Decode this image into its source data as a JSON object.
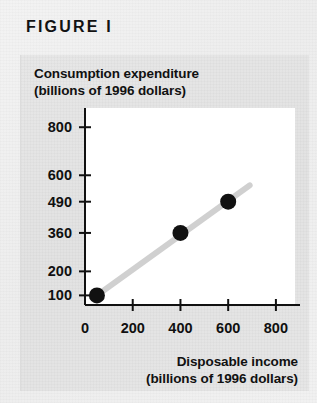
{
  "figure": {
    "label": "FIGURE  I"
  },
  "chart_data": {
    "type": "scatter",
    "title": "",
    "ylabel_line1": "Consumption expenditure",
    "ylabel_line2": "(billions of 1996 dollars)",
    "xlabel_line1": "Disposable income",
    "xlabel_line2": "(billions of 1996 dollars)",
    "x": [
      50,
      400,
      600
    ],
    "values": [
      100,
      360,
      490
    ],
    "points": [
      {
        "x": 50,
        "y": 100
      },
      {
        "x": 400,
        "y": 360
      },
      {
        "x": 600,
        "y": 490
      }
    ],
    "series": [
      {
        "name": "Consumption function",
        "x": [
          50,
          400,
          600
        ],
        "values": [
          100,
          360,
          490
        ]
      }
    ],
    "trend_line": {
      "x_start": 50,
      "y_start": 100,
      "x_end": 690,
      "y_end": 558,
      "color": "#d0d0d0"
    },
    "xticks": [
      0,
      200,
      400,
      600,
      800
    ],
    "xticklabels": [
      "0",
      "200",
      "400",
      "600",
      "800"
    ],
    "yticks": [
      100,
      200,
      360,
      490,
      600,
      800
    ],
    "yticklabels": [
      "100",
      "200",
      "360",
      "490",
      "600",
      "800"
    ],
    "xlim": [
      0,
      880
    ],
    "ylim": [
      60,
      880
    ],
    "grid": false,
    "legend": "none",
    "point_color": "#111111",
    "axis_color": "#111111",
    "plot_bg": "#ffffff"
  }
}
